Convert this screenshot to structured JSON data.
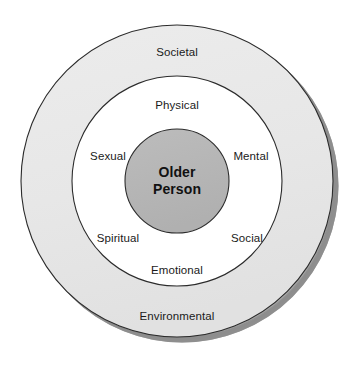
{
  "diagram": {
    "geometry": {
      "width": 355,
      "height": 365,
      "center_x": 177,
      "center_y": 181,
      "outer_radius": 156,
      "middle_radius": 105,
      "core_radius": 52
    },
    "colors": {
      "background": "#ffffff",
      "outer_ring_fill": "#e8e8e8",
      "middle_ring_fill": "#ffffff",
      "core_fill": "#b6b6b6",
      "stroke": "#2b2b2b",
      "shadow": "#8e8e8e",
      "text": "#1a1a1a"
    },
    "rings": [
      {
        "name": "outer-ring",
        "fill": "#e8e8e8",
        "labels": [
          {
            "id": "societal",
            "text": "Societal",
            "x": 177,
            "y": 52
          },
          {
            "id": "environmental",
            "text": "Environmental",
            "x": 177,
            "y": 316
          }
        ]
      },
      {
        "name": "middle-ring",
        "fill": "#ffffff",
        "labels": [
          {
            "id": "physical",
            "text": "Physical",
            "x": 177,
            "y": 105
          },
          {
            "id": "sexual",
            "text": "Sexual",
            "x": 108,
            "y": 156
          },
          {
            "id": "mental",
            "text": "Mental",
            "x": 251,
            "y": 156
          },
          {
            "id": "spiritual",
            "text": "Spiritual",
            "x": 118,
            "y": 238
          },
          {
            "id": "social",
            "text": "Social",
            "x": 247,
            "y": 238
          },
          {
            "id": "emotional",
            "text": "Emotional",
            "x": 177,
            "y": 270
          }
        ]
      }
    ],
    "core": {
      "name": "core-circle",
      "fill": "#b6b6b6",
      "x": 177,
      "y": 181,
      "lines": [
        "Older",
        "Person"
      ]
    }
  }
}
